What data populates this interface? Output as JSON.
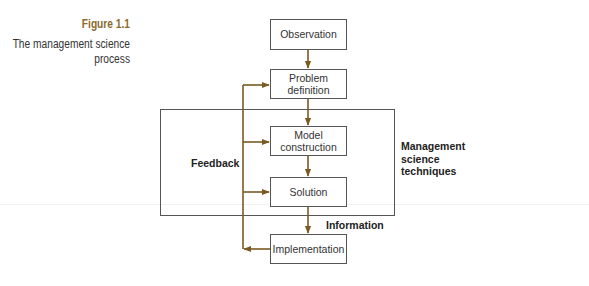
{
  "figure": {
    "number": "Figure 1.1",
    "title_line1": "The management science",
    "title_line2": "process"
  },
  "boxes": {
    "observation": "Observation",
    "problem_line1": "Problem",
    "problem_line2": "definition",
    "model_line1": "Model",
    "model_line2": "construction",
    "solution": "Solution",
    "implementation": "Implementation"
  },
  "labels": {
    "feedback": "Feedback",
    "techniques_line1": "Management",
    "techniques_line2": "science",
    "techniques_line3": "techniques",
    "information": "Information"
  },
  "colors": {
    "arrow": "#7a5a22",
    "caption_accent": "#8a6a2e",
    "box_border": "#555555"
  }
}
